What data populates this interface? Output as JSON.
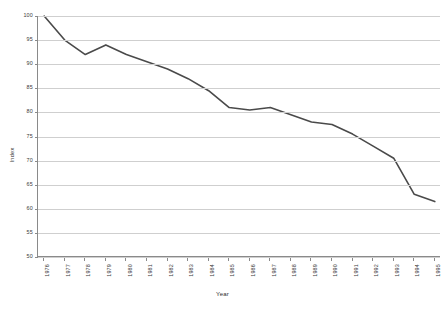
{
  "chart_data": {
    "type": "line",
    "title": "",
    "xlabel": "Year",
    "ylabel": "Index",
    "categories": [
      "1976",
      "1977",
      "1978",
      "1979",
      "1980",
      "1981",
      "1982",
      "1983",
      "1984",
      "1985",
      "1986",
      "1987",
      "1988",
      "1989",
      "1990",
      "1991",
      "1992",
      "1993",
      "1994",
      "1995"
    ],
    "values": [
      100,
      95,
      92,
      94,
      92,
      90.5,
      89,
      87,
      84.5,
      81,
      80.5,
      81,
      79.5,
      78,
      77.5,
      75.5,
      73,
      70.5,
      63,
      61.5
    ],
    "series": [
      {
        "name": "Index",
        "values": [
          100,
          95,
          92,
          94,
          92,
          90.5,
          89,
          87,
          84.5,
          81,
          80.5,
          81,
          79.5,
          78,
          77.5,
          75.5,
          73,
          70.5,
          63,
          61.5
        ]
      }
    ],
    "ylim": [
      50,
      100
    ],
    "yticks": [
      50,
      55,
      60,
      65,
      70,
      75,
      80,
      85,
      90,
      95,
      100
    ],
    "ytick_labels": [
      "50",
      "55",
      "60",
      "65",
      "70",
      "75",
      "80",
      "85",
      "90",
      "95",
      "100"
    ],
    "grid": true,
    "grid_axis": "y",
    "legend": false,
    "line_color": "#4a4a4a",
    "grid_color": "#cfcfcf",
    "axis_color": "#8a8a8a",
    "background": "#ffffff"
  }
}
